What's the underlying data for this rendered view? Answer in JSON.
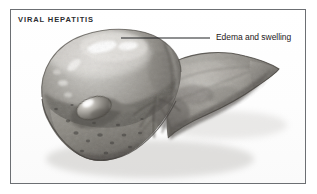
{
  "figure": {
    "title": "VIRAL HEPATITIS",
    "style": "grayscale medical illustration",
    "frame_color": "#6c6f73",
    "background_color": "#ffffff"
  },
  "annotations": [
    {
      "id": "edema",
      "label": "Edema and swelling",
      "leader_from_x": 210,
      "leader_to_x": 121,
      "leader_y": 38,
      "leader_color": "#1e2022",
      "target": "superior surface of right lobe"
    }
  ],
  "anatomy": {
    "liver_base_color": "#8d8d8b",
    "liver_shadow_color": "#4c4b49",
    "liver_highlight_color": "#f2f1ee",
    "gallbladder_label": "gallbladder",
    "gallbladder_color": "#77746f",
    "vessel_color": "#5d5a56"
  }
}
